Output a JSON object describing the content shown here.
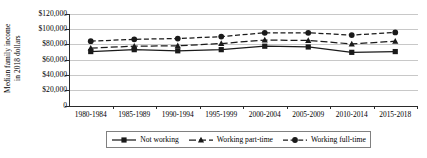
{
  "chart_data": {
    "type": "line",
    "title": "",
    "xlabel": "",
    "ylabel": "Median family income in 2018 dollars",
    "ylabel_lines": [
      "Median family income",
      "in 2018 dollars"
    ],
    "categories": [
      "1980-1984",
      "1985-1989",
      "1990-1994",
      "1995-1999",
      "2000-2004",
      "2005-2009",
      "2010-2014",
      "2015-2018"
    ],
    "ylim": [
      0,
      120000
    ],
    "ytick_values": [
      0,
      20000,
      40000,
      60000,
      80000,
      100000,
      120000
    ],
    "ytick_labels": [
      "0",
      "$20,000",
      "$40,000",
      "$60,000",
      "$80,000",
      "$100,000",
      "$120,000"
    ],
    "grid": "horizontal",
    "legend_position": "bottom",
    "series": [
      {
        "name": "Not working",
        "marker": "square",
        "dash": "solid",
        "color": "#1a1a1a",
        "values": [
          71000,
          73500,
          72000,
          73500,
          78000,
          77000,
          70000,
          71000
        ]
      },
      {
        "name": "Working part-time",
        "marker": "triangle",
        "dash": "long-dash",
        "color": "#1a1a1a",
        "values": [
          75500,
          78000,
          78500,
          81500,
          86000,
          85500,
          81000,
          84500
        ]
      },
      {
        "name": "Working full-time",
        "marker": "circle",
        "dash": "dash",
        "color": "#1a1a1a",
        "values": [
          84500,
          87000,
          88000,
          90500,
          95500,
          95500,
          92500,
          96000
        ]
      }
    ]
  }
}
